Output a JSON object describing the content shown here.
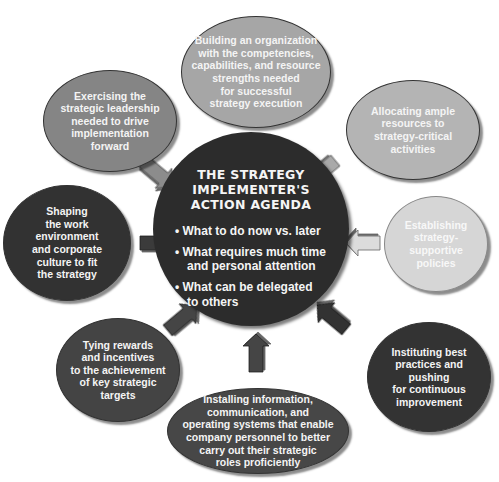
{
  "diagram": {
    "center": {
      "title": "THE STRATEGY\nIMPLEMENTER'S\nACTION AGENDA",
      "bullets": [
        "What to do now vs. later",
        "What requires much time\nand personal attention",
        "What can be delegated\nto others"
      ],
      "bullet_symbol": "•",
      "color": "#2c2c2c"
    },
    "nodes": [
      {
        "id": "top",
        "text": "Building an organization\nwith the competencies,\ncapabilities,  and resource\nstrengths needed\nfor successful\nstrategy execution",
        "color": "#a6a6a6"
      },
      {
        "id": "top-left",
        "text": "Exercising the\nstrategic leadership\nneeded to drive\nimplementation\nforward",
        "color": "#858585"
      },
      {
        "id": "top-right",
        "text": "Allocating ample\nresources to\nstrategy-critical\nactivities",
        "color": "#b4b4b4"
      },
      {
        "id": "left",
        "text": "Shaping\nthe work\nenvironment\nand corporate\nculture to fit\nthe strategy",
        "color": "#323232"
      },
      {
        "id": "right",
        "text": "Establishing\nstrategy-\nsupportive\npolicies",
        "color": "#d6d6d6"
      },
      {
        "id": "bottom-left",
        "text": "Tying rewards\nand incentives\nto the achievement\nof key strategic\ntargets",
        "color": "#444444"
      },
      {
        "id": "bottom-right",
        "text": "Instituting best\npractices and\npushing\nfor continuous\nimprovement",
        "color": "#333333"
      },
      {
        "id": "bottom",
        "text": "Installing information,\ncommunication, and\noperating systems that enable\ncompany personnel to better\ncarry out their strategic\nroles proficiently",
        "color": "#474747"
      }
    ]
  }
}
